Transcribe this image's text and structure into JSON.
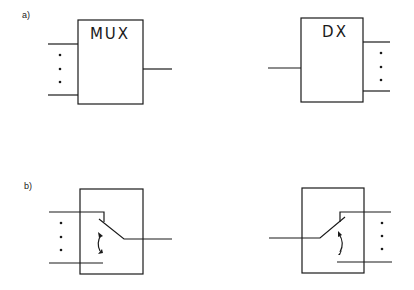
{
  "figure": {
    "panels": [
      {
        "label": "a)",
        "blocks": [
          {
            "name": "multiplexer",
            "title": "MUX",
            "inputs": "many",
            "outputs": "one"
          },
          {
            "name": "demultiplexer",
            "title": "DX",
            "inputs": "one",
            "outputs": "many"
          }
        ]
      },
      {
        "label": "b)",
        "blocks": [
          {
            "name": "multiplexer-switch",
            "title": "",
            "inputs": "many",
            "outputs": "one"
          },
          {
            "name": "demultiplexer-switch",
            "title": "",
            "inputs": "one",
            "outputs": "many"
          }
        ]
      }
    ]
  }
}
